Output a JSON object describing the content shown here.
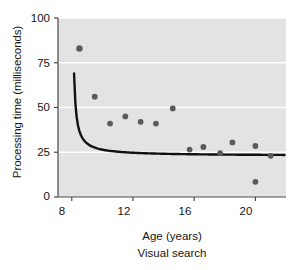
{
  "chart_data": {
    "type": "scatter",
    "title": "",
    "caption": "Visual search",
    "xlabel": "Age (years)",
    "ylabel": "Processing time (milliseconds)",
    "xlim": [
      7.1,
      22.0
    ],
    "ylim": [
      0,
      100
    ],
    "xticks": [
      8,
      12,
      16,
      20
    ],
    "xtick_labels": [
      "8",
      "12",
      "16",
      "20"
    ],
    "yticks": [
      0,
      25,
      50,
      75,
      100
    ],
    "ytick_labels": [
      "0",
      "25",
      "50",
      "75",
      "100"
    ],
    "grid": "horizontal",
    "legend": "none",
    "plot_background": "#e3e3e3",
    "marker_color": "#5a5a5a",
    "curve_color": "#111111",
    "points": [
      {
        "x": 8.5,
        "y": 83.0
      },
      {
        "x": 9.5,
        "y": 56.0
      },
      {
        "x": 10.5,
        "y": 41.0
      },
      {
        "x": 11.5,
        "y": 45.0
      },
      {
        "x": 12.5,
        "y": 42.0
      },
      {
        "x": 13.5,
        "y": 41.0
      },
      {
        "x": 14.6,
        "y": 49.5
      },
      {
        "x": 15.7,
        "y": 26.5
      },
      {
        "x": 16.6,
        "y": 28.0
      },
      {
        "x": 17.7,
        "y": 24.5
      },
      {
        "x": 18.5,
        "y": 30.5
      },
      {
        "x": 20.0,
        "y": 28.5
      },
      {
        "x": 20.0,
        "y": 8.5
      },
      {
        "x": 21.0,
        "y": 23.0
      }
    ],
    "fit_curve": {
      "description": "decreasing power-law trend line",
      "x_start": 8.15,
      "x_end": 21.9,
      "y_start": 69.0,
      "y_end": 23.5
    }
  }
}
